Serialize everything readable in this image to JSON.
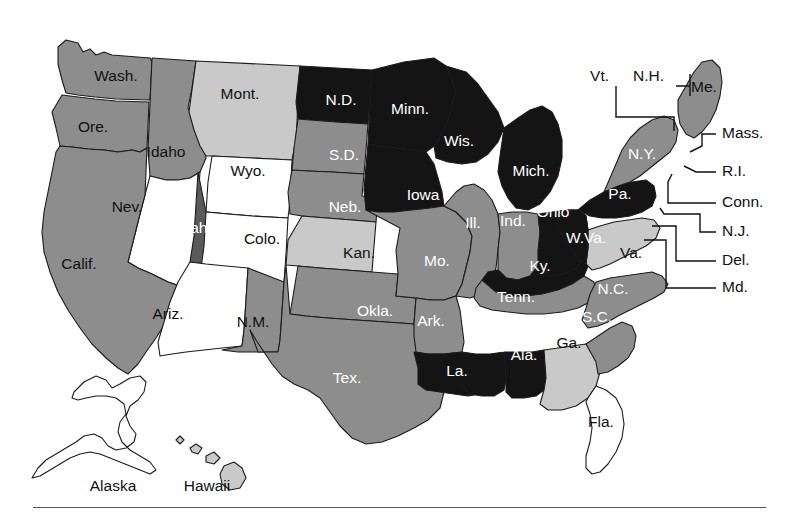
{
  "figure": {
    "type": "choropleth-map",
    "region": "United States",
    "background_color": "#ffffff",
    "border_color": "#1b1b1b",
    "has_bottom_rule": true
  },
  "shading_levels": {
    "white": "#ffffff",
    "light_gray": "#c9c9c9",
    "medium_gray": "#8d8d8d",
    "dark_gray": "#5a5a5a",
    "black": "#141414"
  },
  "states": [
    {
      "code": "WA",
      "label": "Wash.",
      "shade": "medium_gray",
      "label_color": "dark",
      "lx": 116,
      "ly": 77
    },
    {
      "code": "OR",
      "label": "Ore.",
      "shade": "medium_gray",
      "label_color": "dark",
      "lx": 93,
      "ly": 128
    },
    {
      "code": "ID",
      "label": "Idaho",
      "shade": "medium_gray",
      "label_color": "dark",
      "lx": 166,
      "ly": 153
    },
    {
      "code": "MT",
      "label": "Mont.",
      "shade": "light_gray",
      "label_color": "dark",
      "lx": 240,
      "ly": 95
    },
    {
      "code": "WY",
      "label": "Wyo.",
      "shade": "white",
      "label_color": "dark",
      "lx": 248,
      "ly": 172
    },
    {
      "code": "NV",
      "label": "Nev.",
      "shade": "white",
      "label_color": "dark",
      "lx": 127,
      "ly": 208
    },
    {
      "code": "UT",
      "label": "Utah",
      "shade": "dark_gray",
      "label_color": "light",
      "lx": 191,
      "ly": 229
    },
    {
      "code": "CO",
      "label": "Colo.",
      "shade": "white",
      "label_color": "dark",
      "lx": 262,
      "ly": 240
    },
    {
      "code": "CA",
      "label": "Calif.",
      "shade": "medium_gray",
      "label_color": "dark",
      "lx": 79,
      "ly": 265
    },
    {
      "code": "AZ",
      "label": "Ariz.",
      "shade": "white",
      "label_color": "dark",
      "lx": 168,
      "ly": 315
    },
    {
      "code": "NM",
      "label": "N.M.",
      "shade": "medium_gray",
      "label_color": "dark",
      "lx": 253,
      "ly": 323
    },
    {
      "code": "ND",
      "label": "N.D.",
      "shade": "black",
      "label_color": "light",
      "lx": 341,
      "ly": 101
    },
    {
      "code": "SD",
      "label": "S.D.",
      "shade": "medium_gray",
      "label_color": "light",
      "lx": 344,
      "ly": 156
    },
    {
      "code": "NE",
      "label": "Neb.",
      "shade": "medium_gray",
      "label_color": "light",
      "lx": 345,
      "ly": 208
    },
    {
      "code": "KS",
      "label": "Kan.",
      "shade": "light_gray",
      "label_color": "dark",
      "lx": 359,
      "ly": 254
    },
    {
      "code": "OK",
      "label": "Okla.",
      "shade": "medium_gray",
      "label_color": "light",
      "lx": 375,
      "ly": 312
    },
    {
      "code": "TX",
      "label": "Tex.",
      "shade": "medium_gray",
      "label_color": "light",
      "lx": 347,
      "ly": 379
    },
    {
      "code": "MN",
      "label": "Minn.",
      "shade": "black",
      "label_color": "light",
      "lx": 410,
      "ly": 110
    },
    {
      "code": "IA",
      "label": "Iowa",
      "shade": "black",
      "label_color": "light",
      "lx": 423,
      "ly": 196
    },
    {
      "code": "MO",
      "label": "Mo.",
      "shade": "medium_gray",
      "label_color": "light",
      "lx": 437,
      "ly": 262
    },
    {
      "code": "AR",
      "label": "Ark.",
      "shade": "medium_gray",
      "label_color": "light",
      "lx": 431,
      "ly": 322
    },
    {
      "code": "LA",
      "label": "La.",
      "shade": "black",
      "label_color": "light",
      "lx": 457,
      "ly": 372
    },
    {
      "code": "WI",
      "label": "Wis.",
      "shade": "black",
      "label_color": "light",
      "lx": 459,
      "ly": 142
    },
    {
      "code": "IL",
      "label": "Ill.",
      "shade": "medium_gray",
      "label_color": "light",
      "lx": 473,
      "ly": 224
    },
    {
      "code": "MI",
      "label": "Mich.",
      "shade": "black",
      "label_color": "light",
      "lx": 531,
      "ly": 172
    },
    {
      "code": "IN",
      "label": "Ind.",
      "shade": "medium_gray",
      "label_color": "light",
      "lx": 513,
      "ly": 222
    },
    {
      "code": "OH",
      "label": "Ohio",
      "shade": "black",
      "label_color": "light",
      "lx": 553,
      "ly": 213
    },
    {
      "code": "KY",
      "label": "Ky.",
      "shade": "black",
      "label_color": "light",
      "lx": 540,
      "ly": 267
    },
    {
      "code": "TN",
      "label": "Tenn.",
      "shade": "medium_gray",
      "label_color": "light",
      "lx": 516,
      "ly": 298
    },
    {
      "code": "MS",
      "label": "Miss.",
      "shade": "black",
      "label_color": "light",
      "lx": 487,
      "ly": 348
    },
    {
      "code": "AL",
      "label": "Ala.",
      "shade": "black",
      "label_color": "light",
      "lx": 524,
      "ly": 356
    },
    {
      "code": "GA",
      "label": "Ga.",
      "shade": "light_gray",
      "label_color": "dark",
      "lx": 569,
      "ly": 344
    },
    {
      "code": "FL",
      "label": "Fla.",
      "shade": "white",
      "label_color": "dark",
      "lx": 601,
      "ly": 423
    },
    {
      "code": "SC",
      "label": "S.C.",
      "shade": "medium_gray",
      "label_color": "light",
      "lx": 597,
      "ly": 318
    },
    {
      "code": "NC",
      "label": "N.C.",
      "shade": "medium_gray",
      "label_color": "light",
      "lx": 613,
      "ly": 290
    },
    {
      "code": "VA",
      "label": "Va.",
      "shade": "light_gray",
      "label_color": "dark",
      "lx": 631,
      "ly": 254
    },
    {
      "code": "WV",
      "label": "W.Va.",
      "shade": "black",
      "label_color": "light",
      "lx": 586,
      "ly": 239
    },
    {
      "code": "PA",
      "label": "Pa.",
      "shade": "black",
      "label_color": "light",
      "lx": 620,
      "ly": 195
    },
    {
      "code": "NY",
      "label": "N.Y.",
      "shade": "medium_gray",
      "label_color": "light",
      "lx": 642,
      "ly": 155
    },
    {
      "code": "ME",
      "label": "Me.",
      "shade": "medium_gray",
      "label_color": "dark",
      "lx": 704,
      "ly": 88
    }
  ],
  "callouts": [
    {
      "code": "VT",
      "label": "Vt.",
      "side": "left",
      "tx": 609,
      "ty": 77
    },
    {
      "code": "NH",
      "label": "N.H.",
      "side": "left",
      "tx": 664,
      "ty": 77
    },
    {
      "code": "MA",
      "label": "Mass.",
      "side": "right",
      "tx": 722,
      "ty": 134
    },
    {
      "code": "RI",
      "label": "R.I.",
      "side": "right",
      "tx": 722,
      "ty": 172
    },
    {
      "code": "CT",
      "label": "Conn.",
      "side": "right",
      "tx": 722,
      "ty": 203
    },
    {
      "code": "NJ",
      "label": "N.J.",
      "side": "right",
      "tx": 722,
      "ty": 232
    },
    {
      "code": "DE",
      "label": "Del.",
      "side": "right",
      "tx": 722,
      "ty": 261
    },
    {
      "code": "MD",
      "label": "Md.",
      "side": "right",
      "tx": 722,
      "ty": 288
    }
  ],
  "insets": [
    {
      "code": "AK",
      "label": "Alaska",
      "shade": "white",
      "label_color": "dark",
      "lx": 113,
      "ly": 487
    },
    {
      "code": "HI",
      "label": "Hawaii",
      "shade": "light_gray",
      "label_color": "dark",
      "lx": 207,
      "ly": 487
    }
  ]
}
